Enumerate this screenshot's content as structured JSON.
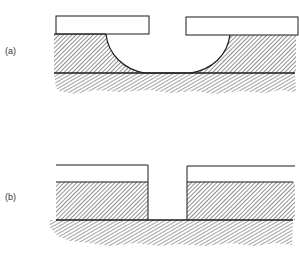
{
  "figure": {
    "panels": [
      {
        "id": "a",
        "label": "(a)",
        "description": "Isotropic etch: curved undercut beneath mask opening"
      },
      {
        "id": "b",
        "label": "(b)",
        "description": "Anisotropic etch: vertical sidewalls beneath mask opening"
      }
    ],
    "colors": {
      "line": "#1a1a1a",
      "hatch": "#333333",
      "background": "#ffffff"
    }
  }
}
